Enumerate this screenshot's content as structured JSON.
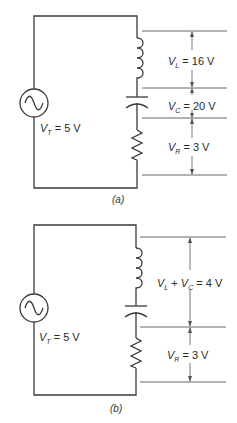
{
  "figure_a": {
    "caption": "(a)",
    "source": {
      "symbol": "V",
      "subscript": "T",
      "value": " = 5 V"
    },
    "measurements": [
      {
        "symbol": "V",
        "subscript": "L",
        "value": " = 16 V"
      },
      {
        "symbol": "V",
        "subscript": "C",
        "value": " = 20 V"
      },
      {
        "symbol": "V",
        "subscript": "R",
        "value": " = 3 V"
      }
    ]
  },
  "figure_b": {
    "caption": "(b)",
    "source": {
      "symbol": "V",
      "subscript": "T",
      "value": " = 5 V"
    },
    "measurements": [
      {
        "symbol": "V",
        "subscript": "L",
        "plus": " + ",
        "symbol2": "V",
        "subscript2": "C",
        "value": " = 4 V"
      },
      {
        "symbol": "V",
        "subscript": "R",
        "value": " = 3 V"
      }
    ]
  },
  "colors": {
    "wire": "#3a3a3a",
    "dimension": "#555555",
    "text": "#2a2a2a",
    "background": "#ffffff"
  }
}
